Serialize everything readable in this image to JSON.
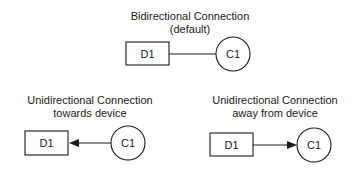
{
  "diagram": {
    "panels": [
      {
        "id": "bidirectional",
        "title_line1": "Bidirectional Connection",
        "title_line2": "(default)",
        "device_label": "D1",
        "connector_label": "C1",
        "direction": "none"
      },
      {
        "id": "towards-device",
        "title_line1": "Unidirectional Connection",
        "title_line2": "towards device",
        "device_label": "D1",
        "connector_label": "C1",
        "direction": "connector-to-device"
      },
      {
        "id": "away-from-device",
        "title_line1": "Unidirectional Connection",
        "title_line2": "away from device",
        "device_label": "D1",
        "connector_label": "C1",
        "direction": "device-to-connector"
      }
    ],
    "colors": {
      "stroke": "#1a1a1a",
      "background": "#ffffff"
    }
  }
}
